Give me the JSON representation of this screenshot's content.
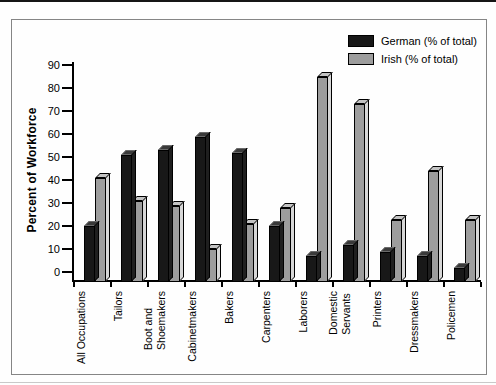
{
  "figure": {
    "background": "#fefefe",
    "frame_border_color": "#858585",
    "top_strip_color": "#151515"
  },
  "chart_data": {
    "type": "bar",
    "title": "",
    "xlabel": "",
    "ylabel": "Percent of Workforce",
    "ylim": [
      0,
      90
    ],
    "ytick_step": 10,
    "grid": false,
    "legend_position": "top-right",
    "style": "3d-bars",
    "ytick_labels": [
      "0",
      "10",
      "20",
      "30",
      "40",
      "50",
      "60",
      "70",
      "80",
      "90"
    ],
    "categories": [
      "All Occupations",
      "Tailors",
      "Boot and\nShoemakers",
      "Cabinetmakers",
      "Bakers",
      "Carpenters",
      "Laborers",
      "Domestic\nServants",
      "Printers",
      "Dressmakers",
      "Policemen"
    ],
    "series": [
      {
        "name": "German (% of total)",
        "color": "#181818",
        "top_color": "#3a3a3a",
        "side_color": "#1f1f1f",
        "values": [
          22,
          53,
          55,
          61,
          54,
          22,
          9,
          14,
          11,
          9,
          4
        ]
      },
      {
        "name": "Irish (% of total)",
        "color": "#9d9d9d",
        "top_color": "#c3c3c3",
        "side_color": "#d7d7d7",
        "values": [
          43,
          33,
          31,
          12,
          23,
          30,
          87,
          75,
          25,
          46,
          25
        ]
      }
    ]
  }
}
